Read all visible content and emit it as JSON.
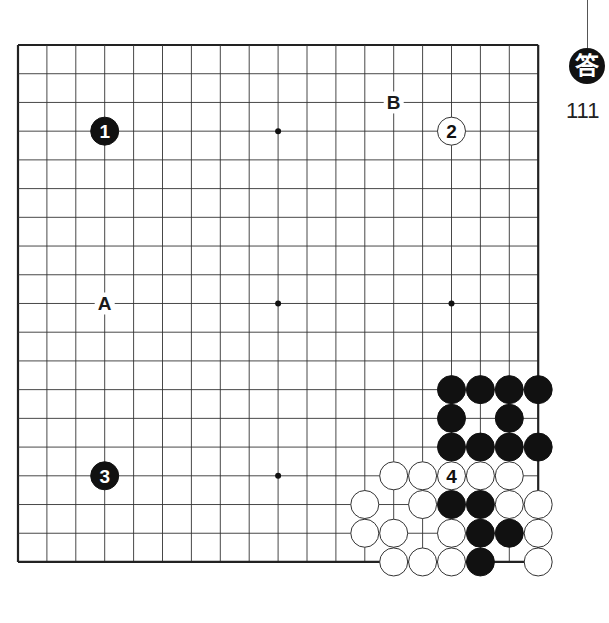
{
  "header": {
    "answer_badge": "答",
    "problem_number": "111"
  },
  "board": {
    "size": 19,
    "origin_x": 18,
    "origin_y": 45,
    "spacing_x": 28.9,
    "spacing_y": 28.72,
    "line_color": "#333333",
    "border_color": "#222222",
    "star_points": [
      [
        3,
        3
      ],
      [
        9,
        3
      ],
      [
        15,
        3
      ],
      [
        3,
        9
      ],
      [
        9,
        9
      ],
      [
        15,
        9
      ],
      [
        3,
        15
      ],
      [
        9,
        15
      ],
      [
        15,
        15
      ]
    ],
    "stones": [
      {
        "color": "black",
        "col": 15,
        "row": 12
      },
      {
        "color": "black",
        "col": 16,
        "row": 12
      },
      {
        "color": "black",
        "col": 17,
        "row": 12
      },
      {
        "color": "black",
        "col": 18,
        "row": 12
      },
      {
        "color": "black",
        "col": 15,
        "row": 13
      },
      {
        "color": "black",
        "col": 17,
        "row": 13
      },
      {
        "color": "black",
        "col": 15,
        "row": 14
      },
      {
        "color": "black",
        "col": 16,
        "row": 14
      },
      {
        "color": "black",
        "col": 17,
        "row": 14
      },
      {
        "color": "black",
        "col": 18,
        "row": 14
      },
      {
        "color": "white",
        "col": 13,
        "row": 15
      },
      {
        "color": "white",
        "col": 14,
        "row": 15
      },
      {
        "color": "white",
        "col": 16,
        "row": 15
      },
      {
        "color": "white",
        "col": 17,
        "row": 15
      },
      {
        "color": "white",
        "col": 12,
        "row": 16
      },
      {
        "color": "white",
        "col": 14,
        "row": 16
      },
      {
        "color": "black",
        "col": 15,
        "row": 16
      },
      {
        "color": "black",
        "col": 16,
        "row": 16
      },
      {
        "color": "white",
        "col": 17,
        "row": 16
      },
      {
        "color": "white",
        "col": 18,
        "row": 16
      },
      {
        "color": "white",
        "col": 12,
        "row": 17
      },
      {
        "color": "white",
        "col": 13,
        "row": 17
      },
      {
        "color": "white",
        "col": 15,
        "row": 17
      },
      {
        "color": "black",
        "col": 16,
        "row": 17
      },
      {
        "color": "black",
        "col": 17,
        "row": 17
      },
      {
        "color": "white",
        "col": 18,
        "row": 17
      },
      {
        "color": "white",
        "col": 13,
        "row": 18
      },
      {
        "color": "white",
        "col": 14,
        "row": 18
      },
      {
        "color": "white",
        "col": 15,
        "row": 18
      },
      {
        "color": "black",
        "col": 16,
        "row": 18
      },
      {
        "color": "white",
        "col": 18,
        "row": 18
      }
    ],
    "numbered_moves": [
      {
        "number": "1",
        "color": "black",
        "col": 3,
        "row": 3
      },
      {
        "number": "2",
        "color": "white",
        "col": 15,
        "row": 3
      },
      {
        "number": "3",
        "color": "black",
        "col": 3,
        "row": 15
      },
      {
        "number": "4",
        "color": "white",
        "col": 15,
        "row": 15
      }
    ],
    "letter_labels": [
      {
        "label": "A",
        "col": 3,
        "row": 9
      },
      {
        "label": "B",
        "col": 13,
        "row": 2
      }
    ]
  }
}
